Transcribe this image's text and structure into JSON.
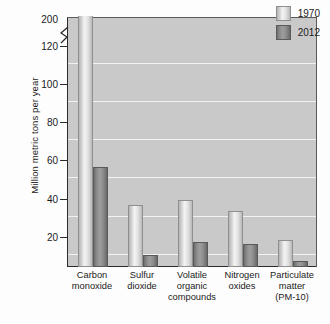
{
  "chart_data": {
    "type": "bar",
    "title": "",
    "subtitle": "",
    "xlabel": "",
    "ylabel": "Million metric tons per year",
    "ylim": [
      0,
      130
    ],
    "y_ticks": [
      20,
      40,
      60,
      80,
      100,
      120,
      200
    ],
    "y_axis_break": true,
    "y_axis_break_note": "Axis is broken between 120 and 200",
    "grid": true,
    "grid_axis": "y",
    "legend_position": "top-right",
    "categories": [
      "Carbon monoxide",
      "Sulfur dioxide",
      "Volatile organic compounds",
      "Nitrogen oxides",
      "Particulate matter (PM-10)"
    ],
    "category_lines": [
      [
        "Carbon",
        "monoxide"
      ],
      [
        "Sulfur",
        "dioxide"
      ],
      [
        "Volatile",
        "organic",
        "compounds"
      ],
      [
        "Nitrogen",
        "oxides"
      ],
      [
        "Particulate",
        "matter",
        "(PM-10)"
      ]
    ],
    "series": [
      {
        "name": "1970",
        "color": "#e2e2e2",
        "values": [
          197,
          31,
          34,
          28,
          13
        ]
      },
      {
        "name": "2012",
        "color": "#8a8a8a",
        "values": [
          51,
          5,
          12,
          11,
          2
        ]
      }
    ]
  },
  "legend": {
    "items": [
      {
        "label": "1970",
        "swatch": "light-gray-bar-swatch"
      },
      {
        "label": "2012",
        "swatch": "dark-gray-bar-swatch"
      }
    ]
  },
  "axis": {
    "y_title": "Million metric tons per year",
    "y_tick_labels": [
      "200",
      "120",
      "100",
      "80",
      "60",
      "40",
      "20"
    ]
  }
}
